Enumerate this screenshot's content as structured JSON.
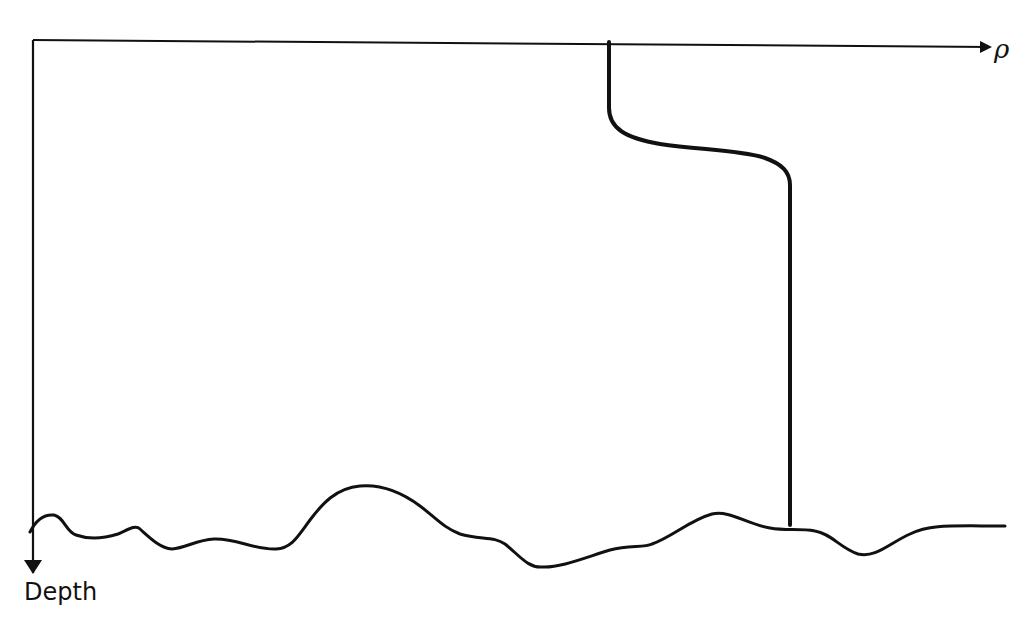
{
  "diagram": {
    "x_axis": {
      "label": "ρ",
      "direction": "right"
    },
    "y_axis": {
      "label": "Depth",
      "direction": "down"
    },
    "colors": {
      "ink": "#111111",
      "background": "#ffffff"
    },
    "elements": [
      {
        "id": "density-profile",
        "description": "Density profile: uniform upper layer, sharp increase (pycnocline), uniform deeper layer reaching the seafloor"
      },
      {
        "id": "seafloor",
        "description": "Irregular bottom topography line"
      }
    ]
  }
}
